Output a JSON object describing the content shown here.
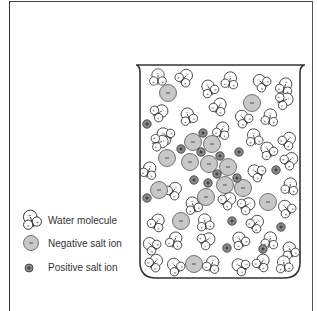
{
  "figure": {
    "type": "diagram"
  },
  "legend": {
    "items": [
      {
        "key": "water",
        "label": "Water molecule"
      },
      {
        "key": "negative",
        "label": "Negative salt ion"
      },
      {
        "key": "positive",
        "label": "Positive salt ion"
      }
    ]
  },
  "symbols": {
    "negative_sign": "−",
    "positive_sign": "+"
  },
  "colors": {
    "line": "#333333",
    "negative_fill": "#c8c8c8",
    "positive_fill": "#8a8a8a",
    "background": "#ffffff"
  },
  "beaker": {
    "rim_y": 65,
    "left_x": 140,
    "right_x": 300,
    "bottom_y": 278,
    "rim_left": 136,
    "rim_right": 305
  },
  "negative_ions": [
    [
      168,
      93
    ],
    [
      252,
      103
    ],
    [
      193,
      142
    ],
    [
      212,
      144
    ],
    [
      167,
      158
    ],
    [
      190,
      162
    ],
    [
      209,
      164
    ],
    [
      228,
      167
    ],
    [
      159,
      190
    ],
    [
      225,
      185
    ],
    [
      243,
      188
    ],
    [
      206,
      197
    ],
    [
      268,
      202
    ],
    [
      181,
      221
    ],
    [
      194,
      264
    ]
  ],
  "positive_ions": [
    [
      147,
      124
    ],
    [
      203,
      133
    ],
    [
      181,
      149
    ],
    [
      201,
      152
    ],
    [
      220,
      156
    ],
    [
      239,
      152
    ],
    [
      217,
      174
    ],
    [
      237,
      178
    ],
    [
      194,
      180
    ],
    [
      208,
      183
    ],
    [
      276,
      170
    ],
    [
      147,
      198
    ],
    [
      232,
      221
    ],
    [
      227,
      248
    ],
    [
      263,
      249
    ],
    [
      281,
      227
    ]
  ],
  "water_molecules": [
    [
      158,
      77,
      0
    ],
    [
      185,
      77,
      40
    ],
    [
      209,
      88,
      -30
    ],
    [
      230,
      80,
      10
    ],
    [
      261,
      82,
      -50
    ],
    [
      285,
      86,
      20
    ],
    [
      160,
      112,
      60
    ],
    [
      188,
      116,
      -20
    ],
    [
      219,
      106,
      30
    ],
    [
      243,
      118,
      -40
    ],
    [
      270,
      117,
      10
    ],
    [
      285,
      100,
      70
    ],
    [
      165,
      135,
      -60
    ],
    [
      222,
      130,
      20
    ],
    [
      254,
      137,
      -10
    ],
    [
      288,
      140,
      40
    ],
    [
      160,
      142,
      80
    ],
    [
      268,
      150,
      -30
    ],
    [
      290,
      160,
      50
    ],
    [
      149,
      170,
      20
    ],
    [
      256,
      172,
      -60
    ],
    [
      290,
      186,
      10
    ],
    [
      174,
      190,
      40
    ],
    [
      193,
      205,
      -20
    ],
    [
      247,
      205,
      60
    ],
    [
      286,
      208,
      -40
    ],
    [
      157,
      222,
      30
    ],
    [
      205,
      222,
      -10
    ],
    [
      256,
      223,
      40
    ],
    [
      151,
      245,
      -50
    ],
    [
      175,
      240,
      20
    ],
    [
      207,
      240,
      60
    ],
    [
      240,
      240,
      -30
    ],
    [
      270,
      240,
      10
    ],
    [
      290,
      250,
      -20
    ],
    [
      155,
      262,
      40
    ],
    [
      175,
      266,
      -40
    ],
    [
      212,
      264,
      20
    ],
    [
      240,
      266,
      -60
    ],
    [
      262,
      262,
      30
    ],
    [
      284,
      264,
      -10
    ],
    [
      228,
      200,
      50
    ]
  ]
}
